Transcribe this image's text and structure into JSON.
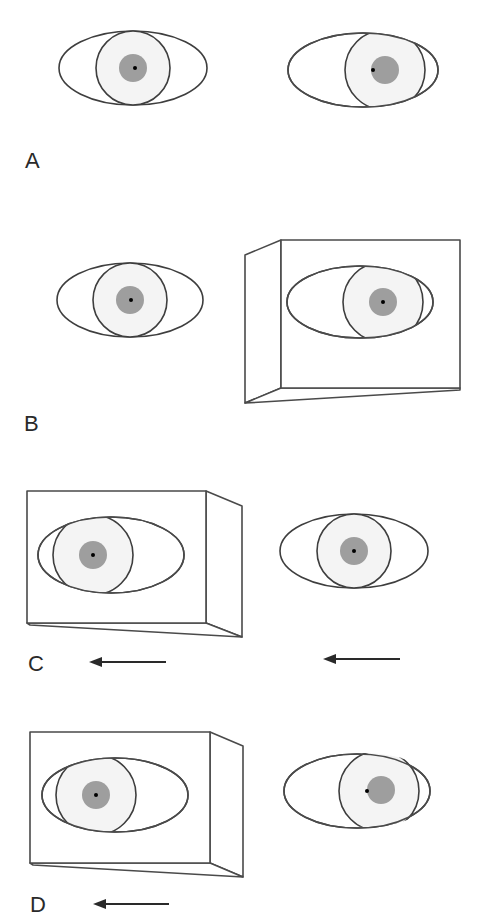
{
  "figure": {
    "colors": {
      "outline": "#3e3e3e",
      "pupil_fill": "#9e9e9e",
      "iris_fill": "#f4f4f4",
      "dot": "#000000",
      "arrow": "#2a2a2a"
    },
    "panels": [
      {
        "label": "A",
        "left_eye": {
          "occluded_by_box": false,
          "gaze": "center",
          "dot": "center"
        },
        "right_eye": {
          "occluded_by_box": false,
          "gaze": "right",
          "dot": "left-of-pupil"
        },
        "arrows": []
      },
      {
        "label": "B",
        "left_eye": {
          "occluded_by_box": false,
          "gaze": "center",
          "dot": "center"
        },
        "right_eye": {
          "occluded_by_box": true,
          "box_side": "left",
          "gaze": "right",
          "dot": "center"
        },
        "arrows": []
      },
      {
        "label": "C",
        "left_eye": {
          "occluded_by_box": true,
          "box_side": "right",
          "gaze": "left",
          "dot": "center"
        },
        "right_eye": {
          "occluded_by_box": false,
          "gaze": "center",
          "dot": "center"
        },
        "arrows": [
          {
            "position": "left",
            "direction": "left"
          },
          {
            "position": "right",
            "direction": "left"
          }
        ]
      },
      {
        "label": "D",
        "left_eye": {
          "occluded_by_box": true,
          "box_side": "right",
          "gaze": "left",
          "dot": "center"
        },
        "right_eye": {
          "occluded_by_box": false,
          "gaze": "slightly-right",
          "dot": "left-of-pupil"
        },
        "arrows": [
          {
            "position": "left",
            "direction": "left"
          }
        ]
      }
    ]
  }
}
